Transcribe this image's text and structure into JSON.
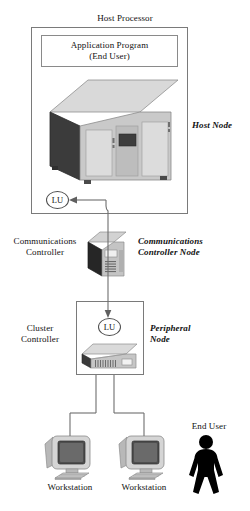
{
  "diagram": {
    "labels": {
      "host_processor": "Host Processor",
      "application_program": "Application Program\n(End User)",
      "host_node": "Host Node",
      "lu_host": "LU",
      "communications_controller": "Communications\nController",
      "communications_controller_node": "Communications\nController Node",
      "cluster_controller": "Cluster\nController",
      "peripheral_node": "Peripheral\nNode",
      "lu_peripheral": "LU",
      "workstation_left": "Workstation",
      "workstation_right": "Workstation",
      "end_user": "End User"
    },
    "icons": {
      "mainframe": "mainframe-computer-icon",
      "comm_controller": "tower-server-icon",
      "cluster_controller": "desktop-chassis-icon",
      "workstation": "crt-monitor-icon",
      "end_user": "person-silhouette-icon",
      "arrow_host": "arrow-left-icon",
      "arrow_peripheral": "arrow-down-icon"
    },
    "colors": {
      "stroke": "#6e6e6e",
      "box_border": "#7a7a7a",
      "text": "#111111",
      "silhouette": "#000000",
      "metal_light": "#d7d7d7",
      "metal_mid": "#b4b4b4",
      "metal_dark": "#3a3a3a"
    }
  }
}
